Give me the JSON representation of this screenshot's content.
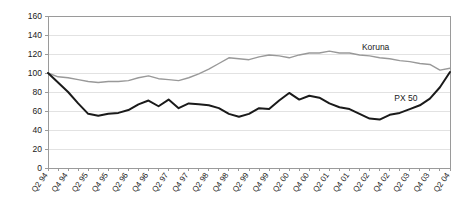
{
  "chart_data": {
    "type": "line",
    "title": "",
    "xlabel": "",
    "ylabel": "",
    "ylim": [
      0,
      160
    ],
    "ytick_step": 20,
    "yticks": [
      0,
      20,
      40,
      60,
      80,
      100,
      120,
      140,
      160
    ],
    "grid": true,
    "grid_axis": "y",
    "legend_position": "inline-annotation",
    "categories": [
      "Q2 94",
      "Q3 94",
      "Q4 94",
      "Q1 95",
      "Q2 95",
      "Q3 95",
      "Q4 95",
      "Q1 96",
      "Q2 96",
      "Q3 96",
      "Q4 96",
      "Q1 97",
      "Q2 97",
      "Q3 97",
      "Q4 97",
      "Q1 98",
      "Q2 98",
      "Q3 98",
      "Q4 98",
      "Q1 99",
      "Q2 99",
      "Q3 99",
      "Q4 99",
      "Q1 00",
      "Q2 00",
      "Q3 00",
      "Q4 00",
      "Q1 01",
      "Q2 01",
      "Q3 01",
      "Q4 01",
      "Q1 02",
      "Q2 02",
      "Q3 02",
      "Q4 02",
      "Q1 03",
      "Q2 03",
      "Q3 03",
      "Q4 03",
      "Q1 04",
      "Q2 04"
    ],
    "xtick_labels": [
      "Q2 94",
      "Q4 94",
      "Q2 95",
      "Q4 95",
      "Q2 96",
      "Q4 96",
      "Q2 97",
      "Q4 97",
      "Q2 98",
      "Q4 98",
      "Q2 99",
      "Q4 99",
      "Q2 00",
      "Q4 00",
      "Q2 01",
      "Q4 01",
      "Q2 02",
      "Q4 02",
      "Q2 03",
      "Q4 03",
      "Q2 04"
    ],
    "xtick_label_every": 2,
    "series": [
      {
        "name": "Koruna",
        "color": "#999999",
        "width": 1.4,
        "label_text": "Koruna",
        "label_point_index": 33,
        "values": [
          100,
          96,
          95,
          93,
          91,
          90,
          91,
          91,
          92,
          95,
          97,
          94,
          93,
          92,
          95,
          99,
          104,
          110,
          116,
          115,
          114,
          117,
          119,
          118,
          116,
          119,
          121,
          121,
          123,
          121,
          121,
          119,
          118,
          116,
          115,
          113,
          112,
          110,
          109,
          103,
          105
        ]
      },
      {
        "name": "PX 50",
        "color": "#1a1a1a",
        "width": 2.0,
        "label_text": "PX 50",
        "label_point_index": 36,
        "values": [
          100,
          90,
          80,
          68,
          57,
          55,
          57,
          58,
          61,
          67,
          71,
          65,
          72,
          63,
          68,
          67,
          66,
          63,
          57,
          54,
          57,
          63,
          62,
          71,
          79,
          72,
          76,
          74,
          68,
          64,
          62,
          57,
          52,
          51,
          56,
          58,
          62,
          66,
          73,
          85,
          101
        ]
      }
    ]
  },
  "plot": {
    "left": 48,
    "right": 450,
    "top": 16,
    "bottom": 168,
    "axis_color": "#9a9a9a",
    "grid_color": "#e2e2e2",
    "background": "#ffffff"
  }
}
